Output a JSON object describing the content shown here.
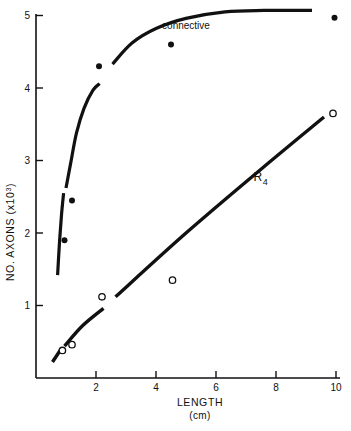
{
  "chart_data": {
    "type": "scatter",
    "title": "",
    "xlabel": "LENGTH",
    "xlabel_units": "(cm)",
    "ylabel": "NO. AXONS",
    "ylabel_units": "(x10",
    "ylabel_exponent": "3",
    "ylabel_units_close": ")",
    "xlim": [
      0,
      10.5
    ],
    "ylim": [
      0,
      5.3
    ],
    "xticks": [
      2,
      4,
      6,
      8,
      10
    ],
    "xtick_labels": [
      "2",
      "4",
      "6",
      "8",
      "10"
    ],
    "yticks": [
      1,
      2,
      3,
      4,
      5
    ],
    "ytick_labels": [
      "1",
      "2",
      "3",
      "4",
      "5"
    ],
    "grid": false,
    "legend": "none",
    "annotations": [
      {
        "text": "connective",
        "x": 5.0,
        "y": 4.82,
        "name": "connective-label"
      },
      {
        "text": "R",
        "sub": "4",
        "x": 7.25,
        "y": 2.72,
        "name": "r4-label"
      }
    ],
    "series": [
      {
        "name": "connective",
        "marker": "filled-circle",
        "marker_color": "#111111",
        "points": [
          {
            "x": 0.95,
            "y": 1.9
          },
          {
            "x": 1.2,
            "y": 2.45
          },
          {
            "x": 2.1,
            "y": 4.3
          },
          {
            "x": 4.5,
            "y": 4.6
          },
          {
            "x": 9.95,
            "y": 4.97
          }
        ],
        "curve": {
          "style": "solid",
          "width": 3.2,
          "segments": [
            {
              "path_points": [
                [
                  0.72,
                  1.42
                ],
                [
                  0.78,
                  1.85
                ],
                [
                  0.85,
                  2.25
                ],
                [
                  0.92,
                  2.55
                ]
              ]
            },
            {
              "path_points": [
                [
                  1.0,
                  2.62
                ],
                [
                  1.15,
                  2.95
                ],
                [
                  1.35,
                  3.38
                ],
                [
                  1.6,
                  3.72
                ],
                [
                  1.9,
                  3.97
                ],
                [
                  2.12,
                  4.06
                ]
              ]
            },
            {
              "path_points": [
                [
                  2.55,
                  4.33
                ],
                [
                  3.2,
                  4.62
                ],
                [
                  4.0,
                  4.82
                ],
                [
                  5.0,
                  4.96
                ],
                [
                  6.3,
                  5.05
                ],
                [
                  7.6,
                  5.07
                ],
                [
                  9.2,
                  5.07
                ]
              ]
            }
          ]
        }
      },
      {
        "name": "R4",
        "marker": "open-circle",
        "marker_color": "#111111",
        "points": [
          {
            "x": 0.88,
            "y": 0.38
          },
          {
            "x": 1.2,
            "y": 0.46
          },
          {
            "x": 2.2,
            "y": 1.12
          },
          {
            "x": 4.55,
            "y": 1.35
          },
          {
            "x": 9.9,
            "y": 3.65
          }
        ],
        "curve": {
          "style": "solid",
          "width": 3.4,
          "segments": [
            {
              "path_points": [
                [
                  0.55,
                  0.22
                ],
                [
                  0.82,
                  0.39
                ]
              ]
            },
            {
              "path_points": [
                [
                  0.95,
                  0.44
                ],
                [
                  1.55,
                  0.72
                ],
                [
                  2.25,
                  0.96
                ]
              ]
            },
            {
              "path_points": [
                [
                  2.65,
                  1.12
                ],
                [
                  5.0,
                  2.0
                ],
                [
                  7.5,
                  2.88
                ],
                [
                  9.6,
                  3.6
                ]
              ]
            }
          ]
        }
      }
    ]
  },
  "axes": {
    "x_axis_name": "x-axis",
    "y_axis_name": "y-axis"
  }
}
